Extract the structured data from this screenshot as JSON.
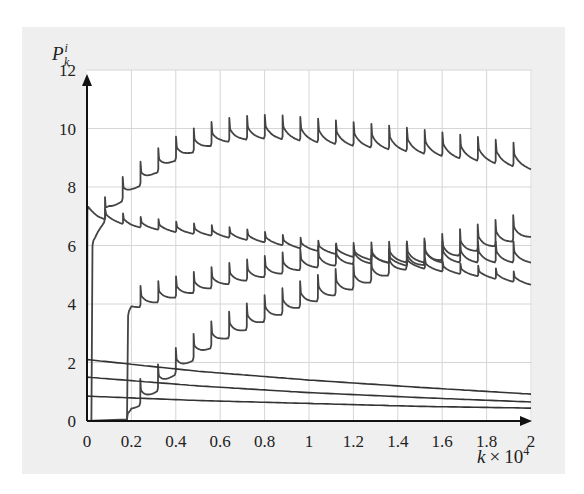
{
  "chart_data": {
    "type": "line",
    "title": "",
    "xlabel": "k × 10^4",
    "xlabel_parts": {
      "var": "k",
      "times": "×",
      "base": "10",
      "exp": "4"
    },
    "ylabel": "P_k^i",
    "ylabel_parts": {
      "base": "P",
      "sup": "i",
      "sub": "k"
    },
    "xlim": [
      0,
      2
    ],
    "ylim": [
      0,
      12
    ],
    "grid": true,
    "legend": null,
    "x_ticks": [
      "0",
      "0.2",
      "0.4",
      "0.6",
      "0.8",
      "1",
      "1.2",
      "1.4",
      "1.6",
      "1.8",
      "2"
    ],
    "y_ticks": [
      "0",
      "2",
      "4",
      "6",
      "8",
      "10",
      "12"
    ],
    "sawtooth_period": 0.08,
    "series": [
      {
        "name": "rising-high",
        "sawtooth": true,
        "spike": 0.45,
        "x": [
          0.02,
          0.025,
          0.05,
          0.1,
          0.2,
          0.3,
          0.4,
          0.5,
          0.6,
          0.7,
          0.8,
          0.9,
          1.0,
          1.2,
          1.4,
          1.6,
          1.8,
          2.0
        ],
        "y": [
          0,
          6.0,
          6.5,
          7.2,
          7.9,
          8.5,
          9.0,
          9.35,
          9.6,
          9.7,
          9.75,
          9.72,
          9.65,
          9.5,
          9.35,
          9.15,
          8.95,
          8.7
        ]
      },
      {
        "name": "declining",
        "sawtooth": true,
        "spike": 0.2,
        "x": [
          0,
          0.002,
          0.05,
          0.2,
          0.4,
          0.6,
          0.8,
          1.0,
          1.2,
          1.4,
          1.6,
          1.8,
          2.0
        ],
        "y": [
          0,
          7.2,
          7.0,
          6.7,
          6.5,
          6.35,
          6.15,
          5.9,
          5.65,
          5.4,
          5.15,
          4.95,
          4.7
        ]
      },
      {
        "name": "rising-mid",
        "sawtooth": true,
        "spike": 0.4,
        "x": [
          0.18,
          0.185,
          0.2,
          0.4,
          0.6,
          0.8,
          1.0,
          1.2,
          1.4,
          1.6,
          1.8,
          2.0
        ],
        "y": [
          0,
          3.6,
          3.9,
          4.3,
          4.7,
          5.0,
          5.3,
          5.45,
          5.5,
          5.5,
          5.5,
          5.5
        ]
      },
      {
        "name": "rising-low",
        "sawtooth": true,
        "spike": 0.5,
        "x": [
          0.0,
          0.18,
          0.2,
          0.3,
          0.4,
          0.5,
          0.6,
          0.8,
          1.0,
          1.2,
          1.4,
          1.6,
          1.8,
          2.0
        ],
        "y": [
          0,
          0.05,
          0.4,
          1.0,
          1.7,
          2.3,
          2.8,
          3.5,
          4.1,
          4.6,
          5.2,
          5.6,
          6.0,
          6.4
        ]
      },
      {
        "name": "decay-1",
        "sawtooth": false,
        "x": [
          0,
          0.5,
          1.0,
          1.5,
          2.0
        ],
        "y": [
          2.1,
          1.7,
          1.4,
          1.15,
          0.92
        ]
      },
      {
        "name": "decay-2",
        "sawtooth": false,
        "x": [
          0,
          0.5,
          1.0,
          1.5,
          2.0
        ],
        "y": [
          1.5,
          1.2,
          0.97,
          0.8,
          0.65
        ]
      },
      {
        "name": "decay-3",
        "sawtooth": false,
        "x": [
          0,
          0.5,
          1.0,
          1.5,
          2.0
        ],
        "y": [
          0.85,
          0.7,
          0.6,
          0.5,
          0.44
        ]
      }
    ]
  },
  "colors": {
    "frame_bg": "#efefef",
    "plot_bg": "#ffffff",
    "grid": "#d6d6d6",
    "axis": "#111111",
    "sawtooth_curve": "#444444",
    "decay_curve": "#333333"
  }
}
